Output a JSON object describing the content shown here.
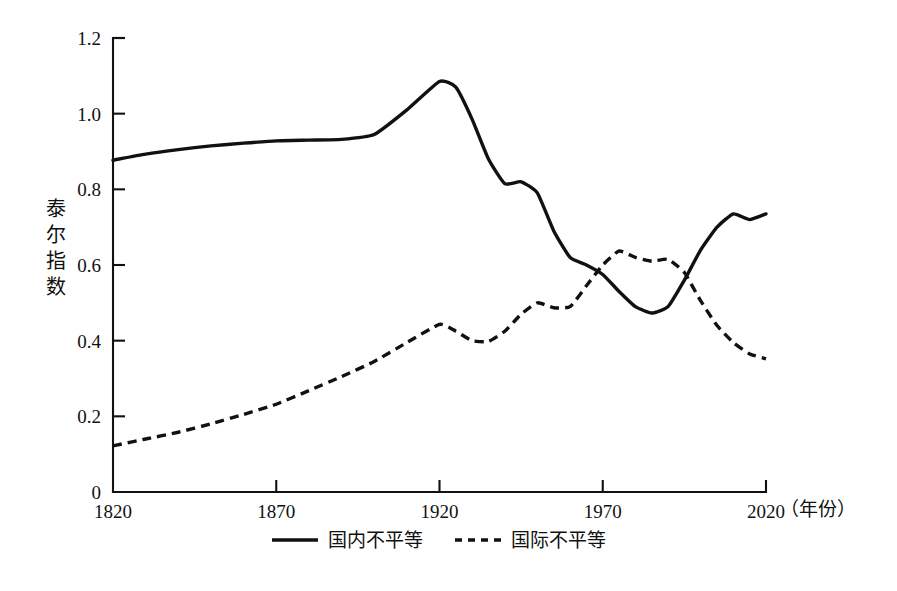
{
  "chart_data": {
    "type": "line",
    "title": "",
    "subtitle": "",
    "xlabel": "（年份）",
    "ylabel": "泰尔指数",
    "xlim": [
      1820,
      2020
    ],
    "ylim": [
      0,
      1.2
    ],
    "grid": false,
    "legend_position": "bottom",
    "x_ticks": [
      "1820",
      "1870",
      "1920",
      "1970",
      "2020"
    ],
    "x_tick_values": [
      1820,
      1870,
      1920,
      1970,
      2020
    ],
    "y_ticks": [
      "0",
      "0.2",
      "0.4",
      "0.6",
      "0.8",
      "1.0",
      "1.2"
    ],
    "y_tick_values": [
      0,
      0.2,
      0.4,
      0.6,
      0.8,
      1.0,
      1.2
    ],
    "series": [
      {
        "name": "国内不平等",
        "style": "solid",
        "x": [
          1820,
          1830,
          1840,
          1850,
          1860,
          1870,
          1880,
          1890,
          1900,
          1910,
          1920,
          1925,
          1930,
          1935,
          1940,
          1945,
          1950,
          1955,
          1960,
          1965,
          1970,
          1975,
          1980,
          1985,
          1990,
          1995,
          2000,
          2005,
          2010,
          2015,
          2020
        ],
        "y": [
          0.877,
          0.893,
          0.905,
          0.915,
          0.922,
          0.928,
          0.93,
          0.932,
          0.945,
          1.01,
          1.085,
          1.07,
          0.985,
          0.88,
          0.815,
          0.82,
          0.79,
          0.69,
          0.62,
          0.6,
          0.575,
          0.53,
          0.49,
          0.473,
          0.49,
          0.56,
          0.64,
          0.7,
          0.735,
          0.72,
          0.735
        ]
      },
      {
        "name": "国际不平等",
        "style": "dashed",
        "x": [
          1820,
          1830,
          1840,
          1850,
          1860,
          1870,
          1880,
          1890,
          1900,
          1910,
          1920,
          1925,
          1930,
          1935,
          1940,
          1945,
          1950,
          1955,
          1960,
          1965,
          1970,
          1975,
          1980,
          1985,
          1990,
          1995,
          2000,
          2005,
          2010,
          2015,
          2020
        ],
        "y": [
          0.122,
          0.14,
          0.158,
          0.18,
          0.205,
          0.232,
          0.268,
          0.305,
          0.345,
          0.395,
          0.443,
          0.425,
          0.4,
          0.398,
          0.425,
          0.47,
          0.5,
          0.487,
          0.49,
          0.545,
          0.6,
          0.637,
          0.62,
          0.61,
          0.615,
          0.58,
          0.505,
          0.44,
          0.395,
          0.365,
          0.352
        ]
      }
    ],
    "legend": [
      {
        "label": "国内不平等",
        "style": "solid"
      },
      {
        "label": "国际不平等",
        "style": "dashed"
      }
    ],
    "colors": {
      "line": "#111111",
      "background": "#ffffff"
    }
  },
  "axes": {
    "y_label_chars": [
      "泰",
      "尔",
      "指",
      "数"
    ],
    "x_unit_label": "（年份）"
  }
}
